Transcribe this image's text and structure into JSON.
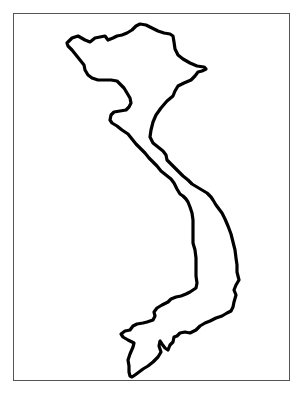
{
  "map": {
    "subject": "Vietnam outline map",
    "frame": {
      "x": 13,
      "y": 13,
      "width": 277,
      "height": 368,
      "border_color": "#555555"
    },
    "outline": {
      "stroke_color": "#000000",
      "fill_color": "#ffffff",
      "path": "M67,43 L72,38 L78,36 L85,40 L90,42 L95,38 L100,37 L105,36 L108,40 L113,38 L117,36 L122,35 L127,33 L132,30 L136,26 L140,24 L146,25 L152,28 L158,31 L164,33 L170,34 L173,36 L174,42 L175,49 L178,55 L183,59 L190,63 L197,66 L204,67 L206,69 L202,71 L198,72 L195,76 L191,80 L184,83 L178,86 L175,91 L173,96 L167,101 L161,108 L156,115 L153,122 L151,130 L150,137 L153,143 L158,147 L163,151 L166,155 L167,160 L171,164 L175,168 L179,172 L183,176 L188,180 L192,184 L197,187 L202,190 L207,193 L211,197 L213,200 L216,205 L219,209 L222,213 L225,219 L228,226 L231,234 L233,242 L235,250 L236,258 L237,265 L237,272 L239,280 L236,285 L234,290 L236,295 L234,302 L233,307 L231,311 L227,313 L222,316 L216,318 L210,321 L205,323 L200,326 L196,330 L190,333 L185,332 L180,333 L177,336 L174,337 L173,342 L170,345 L168,350 L165,348 L162,344 L160,341 L159,346 L161,352 L158,357 L153,362 L148,366 L143,369 L139,372 L135,375 L132,377 L130,376 L129,372 L129,366 L128,360 L130,354 L133,347 L134,343 L128,340 L123,337 L121,334 L125,331 L130,330 L133,326 L137,324 L143,323 L147,322 L153,320 L155,316 L154,312 L157,308 L162,305 L168,302 L171,299 L176,297 L181,296 L186,294 L190,292 L193,290 L196,288 L197,283 L196,276 L196,268 L196,258 L195,250 L193,243 L193,236 L193,228 L193,220 L192,213 L190,207 L188,202 L186,199 L183,196 L180,194 L177,189 L174,183 L171,179 L166,175 L161,171 L157,166 L153,162 L149,158 L145,153 L140,148 L136,144 L132,139 L128,134 L122,130 L117,126 L112,123 L110,120 L111,115 L114,112 L120,111 L126,110 L129,107 L131,103 L130,98 L127,93 L124,88 L121,85 L117,81 L111,80 L104,80 L98,80 L92,78 L88,75 L85,70 L84,65 L80,60 L76,55 L72,50 L68,46 Z"
    }
  }
}
